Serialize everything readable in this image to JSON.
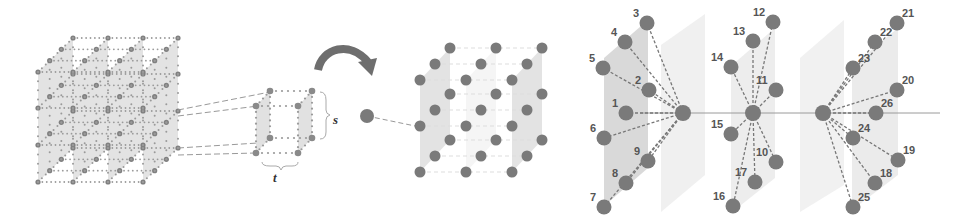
{
  "figure": {
    "panels": [
      {
        "id": "spatiotemporal-volume",
        "description": "4D grid of nodes arranged as stacked slabs"
      },
      {
        "id": "local-cube",
        "description": "Extracted local cube with spatial extent s and temporal extent t"
      },
      {
        "id": "neighborhood-cube",
        "description": "3x3x3 node neighborhood, mapped from a single node"
      },
      {
        "id": "graph-neighbors",
        "description": "Three center nodes connected to 26 numbered neighbors"
      }
    ],
    "labels": {
      "s": "s",
      "t": "t"
    },
    "colors": {
      "node": "#7a7a7a",
      "plane": "#d9d9d9",
      "edge": "#777777",
      "arrow": "#6e6e6e",
      "text": "#555555"
    },
    "centers": [
      {
        "x": 683,
        "y": 113
      },
      {
        "x": 753,
        "y": 113
      },
      {
        "x": 823,
        "y": 113
      }
    ],
    "neighbors": [
      {
        "n": "1",
        "x": 626,
        "y": 113,
        "c": 0
      },
      {
        "n": "2",
        "x": 649,
        "y": 90,
        "c": 0
      },
      {
        "n": "3",
        "x": 647,
        "y": 23,
        "c": 0
      },
      {
        "n": "4",
        "x": 625,
        "y": 42,
        "c": 0
      },
      {
        "n": "5",
        "x": 603,
        "y": 68,
        "c": 0
      },
      {
        "n": "6",
        "x": 604,
        "y": 138,
        "c": 0
      },
      {
        "n": "7",
        "x": 604,
        "y": 207,
        "c": 0
      },
      {
        "n": "8",
        "x": 626,
        "y": 183,
        "c": 0
      },
      {
        "n": "9",
        "x": 648,
        "y": 161,
        "c": 0
      },
      {
        "n": "10",
        "x": 776,
        "y": 162,
        "c": 1
      },
      {
        "n": "11",
        "x": 776,
        "y": 90,
        "c": 1
      },
      {
        "n": "12",
        "x": 773,
        "y": 22,
        "c": 1
      },
      {
        "n": "13",
        "x": 753,
        "y": 41,
        "c": 1
      },
      {
        "n": "14",
        "x": 731,
        "y": 67,
        "c": 1
      },
      {
        "n": "15",
        "x": 731,
        "y": 134,
        "c": 1
      },
      {
        "n": "16",
        "x": 733,
        "y": 206,
        "c": 1
      },
      {
        "n": "17",
        "x": 755,
        "y": 182,
        "c": 1
      },
      {
        "n": "18",
        "x": 875,
        "y": 183,
        "c": 2
      },
      {
        "n": "19",
        "x": 898,
        "y": 160,
        "c": 2
      },
      {
        "n": "20",
        "x": 897,
        "y": 90,
        "c": 2
      },
      {
        "n": "21",
        "x": 897,
        "y": 23,
        "c": 2
      },
      {
        "n": "22",
        "x": 875,
        "y": 42,
        "c": 2
      },
      {
        "n": "23",
        "x": 853,
        "y": 68,
        "c": 2
      },
      {
        "n": "24",
        "x": 853,
        "y": 138,
        "c": 2
      },
      {
        "n": "25",
        "x": 853,
        "y": 207,
        "c": 2
      },
      {
        "n": "26",
        "x": 876,
        "y": 113,
        "c": 2
      }
    ]
  }
}
